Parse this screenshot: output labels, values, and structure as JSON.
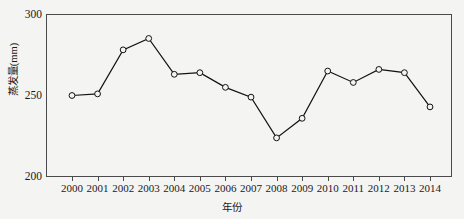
{
  "chart_data": {
    "type": "line",
    "title": "",
    "subtitle": "",
    "xlabel": "年份",
    "ylabel": "蒸发量(mm)",
    "categories": [
      "2000",
      "2001",
      "2002",
      "2003",
      "2004",
      "2005",
      "2006",
      "2007",
      "2008",
      "2009",
      "2010",
      "2011",
      "2012",
      "2013",
      "2014"
    ],
    "values": [
      250,
      251,
      278,
      285,
      263,
      264,
      255,
      249,
      224,
      236,
      265,
      258,
      266,
      264,
      243
    ],
    "series": [
      {
        "name": "蒸发量",
        "values": [
          250,
          251,
          278,
          285,
          263,
          264,
          255,
          249,
          224,
          236,
          265,
          258,
          266,
          264,
          243
        ]
      }
    ],
    "xlim": [
      2000,
      2014
    ],
    "ylim": [
      200,
      300
    ],
    "yticks": [
      200,
      250,
      300
    ],
    "ytick_labels": [
      "200",
      "250",
      "300"
    ],
    "xticks": [
      "2000",
      "2001",
      "2002",
      "2003",
      "2004",
      "2005",
      "2006",
      "2007",
      "2008",
      "2009",
      "2010",
      "2011",
      "2012",
      "2013",
      "2014"
    ],
    "grid": false,
    "legend": false,
    "legend_position": "none",
    "marker": "open-circle",
    "line_color": "#111111",
    "marker_fill": "#f4f4f2",
    "background_color": "#f4f4f2",
    "axis_color": "#4a4a4a"
  },
  "axes": {
    "y_title": "蒸发量(mm)",
    "x_title": "年份",
    "y_labels": [
      "300",
      "250",
      "200"
    ]
  }
}
